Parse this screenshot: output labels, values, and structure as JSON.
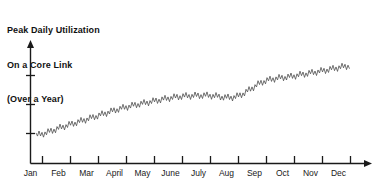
{
  "chart_data": {
    "type": "line",
    "title": "Peak Daily Utilization On a Core Link (Over a Year)",
    "title_lines": [
      "Peak Daily Utilization",
      "On a Core Link",
      "(Over a Year)"
    ],
    "xlabel": "",
    "ylabel": "",
    "grid": false,
    "legend": "none",
    "x_tick_labels": [
      "Jan",
      "Feb",
      "Mar",
      "April",
      "May",
      "June",
      "July",
      "Aug",
      "Sep",
      "Oct",
      "Nov",
      "Dec"
    ],
    "y_tick_labels": [],
    "y_tick_count": 3,
    "axis_arrows": [
      "x-right",
      "y-up"
    ],
    "line_color": "#4d4d4d",
    "axis_color": "#1a1a1a",
    "series": [
      {
        "name": "Peak daily utilization",
        "description": "Daily peak values oscillating with a weekly sawtooth pattern, rising steadily across the year with a plateau in July-August and a step up in early September.",
        "categories": [
          "Jan",
          "Feb",
          "Mar",
          "April",
          "May",
          "June",
          "July",
          "Aug",
          "Sep",
          "Oct",
          "Nov",
          "Dec"
        ],
        "trend_values": [
          22,
          29,
          36,
          43,
          48,
          52,
          53,
          52,
          64,
          68,
          72,
          76
        ],
        "oscillation_amplitude": 3.5,
        "oscillation_period_days": 7
      }
    ],
    "ylim": [
      0,
      100
    ],
    "xlim": [
      0,
      12
    ]
  },
  "axes": {
    "x_axis_name": "time-axis-months",
    "y_axis_name": "utilization-axis"
  }
}
